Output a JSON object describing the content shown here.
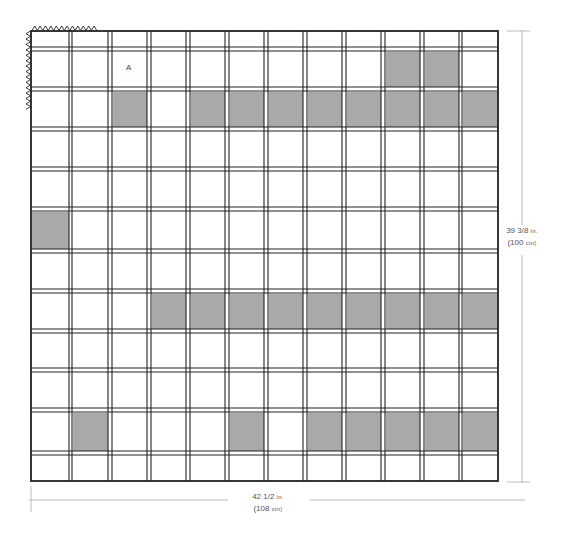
{
  "diagram": {
    "type": "grid-schematic",
    "frame": {
      "x": 31,
      "y": 31,
      "width": 467,
      "height": 450
    },
    "columns": 12,
    "rows": 12,
    "col_line_pairs": [
      [
        69,
        72
      ],
      [
        108,
        112
      ],
      [
        147,
        151
      ],
      [
        186,
        190
      ],
      [
        225,
        229
      ],
      [
        264,
        268
      ],
      [
        303,
        307
      ],
      [
        342,
        346
      ],
      [
        381,
        385
      ],
      [
        420,
        424
      ],
      [
        459,
        462
      ]
    ],
    "row_line_pairs": [
      [
        47,
        51
      ],
      [
        87,
        91
      ],
      [
        127,
        131
      ],
      [
        167,
        171
      ],
      [
        207,
        211
      ],
      [
        249,
        253
      ],
      [
        289,
        293
      ],
      [
        329,
        333
      ],
      [
        368,
        372
      ],
      [
        408,
        412
      ],
      [
        451,
        455
      ]
    ],
    "colors": {
      "line": "#222222",
      "fill_shaded": "#a9a9a9",
      "fill_plain": "#ffffff",
      "dimension_line": "#bbbbbb",
      "text": "#555555"
    },
    "shaded_cells": [
      {
        "row": 1,
        "cols": [
          10,
          11
        ]
      },
      {
        "row": 2,
        "cols": [
          3,
          5,
          6,
          7,
          8,
          9,
          10,
          11,
          12
        ]
      },
      {
        "row": 5,
        "cols": [
          1
        ]
      },
      {
        "row": 7,
        "cols": [
          4,
          5,
          6,
          7,
          8,
          9,
          10,
          11,
          12
        ]
      },
      {
        "row": 10,
        "cols": [
          2,
          6,
          8,
          9,
          10,
          11,
          12
        ]
      }
    ],
    "cell_label": {
      "text": "A",
      "row": 1,
      "col": 3
    },
    "fringe": {
      "top": {
        "x1": 32,
        "x2": 97
      },
      "left": {
        "y1": 31,
        "y2": 110
      }
    }
  },
  "dimensions": {
    "width": {
      "imperial": "42 1/2",
      "imperial_unit": "in.",
      "metric": "(108",
      "metric_unit": "cm)"
    },
    "height": {
      "imperial": "39 3/8",
      "imperial_unit": "in.",
      "metric": "(100",
      "metric_unit": "cm)"
    }
  }
}
